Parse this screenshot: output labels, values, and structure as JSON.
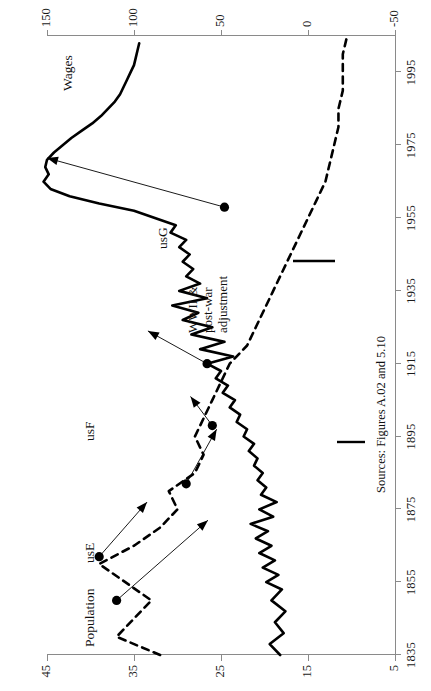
{
  "figure": {
    "source_note": "Sources: Figures A.02 and 5.10",
    "annotation": {
      "line1": "WWII &",
      "line2": "post-war",
      "line3": "adjustment"
    },
    "series_labels": {
      "wages": "Wages",
      "population": "Population",
      "usE": "usE",
      "usF": "usF",
      "usG": "usG"
    }
  },
  "chart_data": {
    "type": "line",
    "title": "",
    "xlabel": "",
    "ylabel": "Population",
    "y2label": "Wages",
    "xlim": [
      1835,
      2005
    ],
    "ylim": [
      5,
      45
    ],
    "y2lim": [
      -50,
      150
    ],
    "grid": false,
    "legend": "inline-labels",
    "xticks": [
      1835,
      1855,
      1875,
      1895,
      1915,
      1935,
      1955,
      1975,
      1995
    ],
    "yticks_left": [
      5,
      15,
      25,
      35,
      45
    ],
    "yticks_right": [
      -50,
      0,
      50,
      100,
      150
    ],
    "annotations": [
      {
        "text": "WWII & post-war adjustment",
        "at_x": 1958,
        "at_y2": 48,
        "points_to_x": 1971,
        "points_to_y2": 150
      },
      {
        "text": "usG",
        "at_x": 1954,
        "at_y2": 133
      },
      {
        "text": "Wages",
        "at_x": 1989,
        "at_y2": 140
      },
      {
        "text": "usF",
        "at_x": 1890,
        "at_y": 38
      },
      {
        "text": "usE",
        "at_x": 1862,
        "at_y": 38
      },
      {
        "text": "Population",
        "at_x": 1840,
        "at_y": 38
      },
      {
        "text": "Sources: Figures A.02 and 5.10",
        "at_x": 1872,
        "at_y": 6
      }
    ],
    "series": [
      {
        "name": "Wages",
        "axis": "right",
        "style": "solid",
        "x": [
          1835,
          1838,
          1841,
          1844,
          1847,
          1850,
          1853,
          1855,
          1857,
          1859,
          1861,
          1863,
          1865,
          1867,
          1869,
          1871,
          1873,
          1875,
          1877,
          1879,
          1881,
          1883,
          1885,
          1887,
          1889,
          1891,
          1893,
          1895,
          1897,
          1899,
          1901,
          1903,
          1905,
          1907,
          1909,
          1911,
          1913,
          1915,
          1917,
          1919,
          1921,
          1923,
          1925,
          1927,
          1929,
          1931,
          1933,
          1935,
          1937,
          1939,
          1941,
          1943,
          1945,
          1947,
          1949,
          1951,
          1953,
          1955,
          1957,
          1959,
          1961,
          1963,
          1965,
          1967,
          1969,
          1971,
          1973,
          1975,
          1977,
          1979,
          1981,
          1983,
          1985,
          1987,
          1989,
          1991,
          1993,
          1995,
          1997,
          1999,
          2001,
          2003
        ],
        "y": [
          16,
          22,
          14,
          19,
          13,
          21,
          15,
          24,
          17,
          26,
          19,
          28,
          21,
          30,
          23,
          33,
          20,
          28,
          18,
          27,
          24,
          29,
          26,
          31,
          29,
          34,
          31,
          37,
          35,
          41,
          39,
          45,
          42,
          49,
          46,
          53,
          50,
          58,
          43,
          62,
          48,
          67,
          55,
          72,
          63,
          78,
          58,
          74,
          62,
          70,
          66,
          72,
          68,
          74,
          70,
          79,
          76,
          88,
          100,
          120,
          137,
          148,
          152,
          149,
          151,
          150,
          146,
          141,
          136,
          130,
          124,
          119,
          115,
          111,
          108,
          106,
          104,
          102,
          100,
          99,
          98,
          97
        ]
      },
      {
        "name": "Population",
        "axis": "left",
        "style": "dashed",
        "x": [
          1835,
          1840,
          1845,
          1850,
          1855,
          1860,
          1865,
          1870,
          1875,
          1880,
          1885,
          1890,
          1895,
          1900,
          1905,
          1910,
          1915,
          1920,
          1925,
          1930,
          1935,
          1940,
          1945,
          1950,
          1955,
          1960,
          1965,
          1970,
          1975,
          1980,
          1985,
          1990,
          1995,
          2000,
          2005
        ],
        "y": [
          32,
          37,
          35,
          33,
          36,
          39,
          35,
          32,
          30,
          31,
          28,
          27,
          28,
          27,
          26,
          25,
          24,
          22,
          21,
          20,
          19,
          18,
          17,
          16,
          15,
          14,
          13,
          12.5,
          12,
          11.5,
          11.5,
          11,
          11,
          11,
          10.5
        ]
      }
    ],
    "markers": [
      {
        "label": "pop-marker-1850",
        "x": 1850,
        "y": 37,
        "axis": "left"
      },
      {
        "label": "pop-marker-1862",
        "x": 1862,
        "y": 39,
        "axis": "left"
      },
      {
        "label": "pop-marker-1882",
        "x": 1882,
        "y": 29,
        "axis": "left"
      },
      {
        "label": "pop-marker-1898",
        "x": 1898,
        "y": 26,
        "axis": "left"
      },
      {
        "label": "wages-marker-1915",
        "x": 1915,
        "y2": 58,
        "axis": "right"
      },
      {
        "label": "wages-marker-1958",
        "x": 1958,
        "y2": 48,
        "axis": "right"
      }
    ]
  }
}
